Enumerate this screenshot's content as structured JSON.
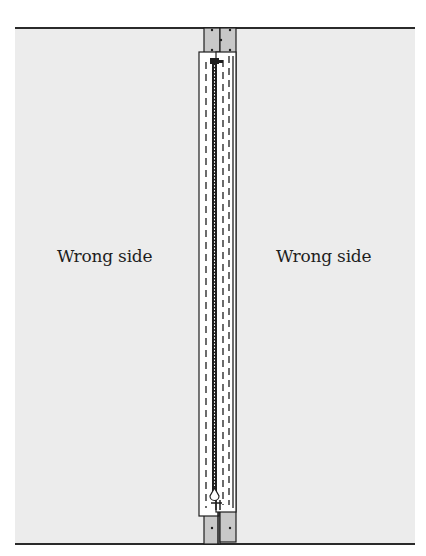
{
  "diagram": {
    "left_panel": {
      "label": "Wrong side"
    },
    "right_panel": {
      "label": "Wrong side"
    },
    "colors": {
      "fabric": "#ececec",
      "tape": "#c8c8c8",
      "facing": "#ffffff",
      "line": "#1e1e1e"
    },
    "components": [
      "left-zipper-tape",
      "right-zipper-tape",
      "left-seam-allowance",
      "right-seam-allowance",
      "zipper-teeth",
      "stitching-lines",
      "zipper-pull"
    ]
  }
}
